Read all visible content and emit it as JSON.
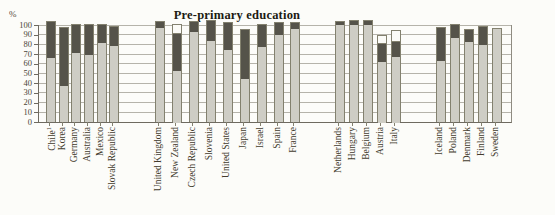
{
  "title": "Pre-primary education",
  "chart_data": {
    "type": "bar",
    "stacked": true,
    "title": "Pre-primary education",
    "ylabel": "%",
    "ylim": [
      0,
      100
    ],
    "yticks": [
      0,
      10,
      20,
      30,
      40,
      50,
      60,
      70,
      80,
      90,
      100
    ],
    "grid": true,
    "legend": "none visible",
    "segment_colors": {
      "light": "#cecdc5",
      "dark": "#55534a",
      "white": "#fbfbf7"
    },
    "segment_order_bottom_to_top": [
      "light",
      "dark",
      "white"
    ],
    "groups": [
      {
        "bars": [
          {
            "label": "Chile",
            "sup": "1",
            "light": 66,
            "dark": 37,
            "white": 0
          },
          {
            "label": "Korea",
            "light": 37,
            "dark": 60,
            "white": 0
          },
          {
            "label": "Germany",
            "light": 71,
            "dark": 29,
            "white": 0
          },
          {
            "label": "Australia",
            "light": 69,
            "dark": 31,
            "white": 0
          },
          {
            "label": "Mexico",
            "light": 81,
            "dark": 19,
            "white": 0
          },
          {
            "label": "Slovak Republic",
            "light": 78,
            "dark": 20,
            "white": 0
          }
        ]
      },
      {
        "bars": [
          {
            "label": "United Kingdom",
            "light": 97,
            "dark": 6,
            "white": 0
          },
          {
            "label": "New Zealand",
            "light": 54,
            "dark": 38,
            "white": 8
          },
          {
            "label": "Czech Republic",
            "light": 93,
            "dark": 10,
            "white": 0
          },
          {
            "label": "Slovenia",
            "light": 83,
            "dark": 21,
            "white": 0
          },
          {
            "label": "United States",
            "light": 74,
            "dark": 28,
            "white": 0
          },
          {
            "label": "Japan",
            "light": 44,
            "dark": 51,
            "white": 0
          },
          {
            "label": "Israel",
            "light": 77,
            "dark": 23,
            "white": 0
          },
          {
            "label": "Spain",
            "light": 90,
            "dark": 12,
            "white": 0
          },
          {
            "label": "France",
            "light": 96,
            "dark": 6,
            "white": 0
          }
        ]
      },
      {
        "bars": [
          {
            "label": "Netherlands",
            "light": 100,
            "dark": 3,
            "white": 0
          },
          {
            "label": "Hungary",
            "light": 100,
            "dark": 4,
            "white": 0
          },
          {
            "label": "Belgium",
            "light": 100,
            "dark": 4,
            "white": 0
          },
          {
            "label": "Austria",
            "light": 63,
            "dark": 18,
            "white": 8
          },
          {
            "label": "Italy",
            "light": 68,
            "dark": 15,
            "white": 11
          }
        ]
      },
      {
        "bars": [
          {
            "label": "Iceland",
            "light": 63,
            "dark": 34,
            "white": 0
          },
          {
            "label": "Poland",
            "light": 87,
            "dark": 13,
            "white": 0
          },
          {
            "label": "Denmark",
            "light": 82,
            "dark": 13,
            "white": 0
          },
          {
            "label": "Finland",
            "light": 79,
            "dark": 19,
            "white": 0
          },
          {
            "label": "Sweden",
            "light": 96,
            "dark": 0,
            "white": 0
          }
        ]
      }
    ]
  }
}
